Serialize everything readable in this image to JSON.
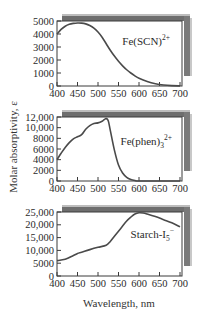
{
  "figure": {
    "ylabel": "Molar absorptivity, ε",
    "xlabel": "Wavelength, nm"
  },
  "chart_data": [
    {
      "type": "line",
      "title": "",
      "label": "Fe(SCN)",
      "label_sup": "2+",
      "label_sub": "",
      "xlabel": "Wavelength, nm",
      "ylabel": "Molar absorptivity, ε",
      "xlim": [
        400,
        700
      ],
      "ylim": [
        0,
        5000
      ],
      "xticks": [
        400,
        450,
        500,
        550,
        600,
        650,
        700
      ],
      "yticks": [
        0,
        1000,
        2000,
        3000,
        4000,
        5000
      ],
      "ytick_labels": [
        "0",
        "1000",
        "2000",
        "3000",
        "4000",
        "5000"
      ],
      "grid": false,
      "x": [
        400,
        410,
        420,
        430,
        440,
        450,
        460,
        470,
        480,
        490,
        500,
        510,
        520,
        530,
        540,
        550,
        560,
        570,
        580,
        590,
        600,
        620,
        640,
        660,
        680,
        700
      ],
      "y": [
        4000,
        4350,
        4600,
        4750,
        4820,
        4850,
        4840,
        4780,
        4650,
        4450,
        4150,
        3750,
        3250,
        2750,
        2300,
        1900,
        1550,
        1250,
        1000,
        780,
        600,
        350,
        180,
        80,
        30,
        10
      ]
    },
    {
      "type": "line",
      "title": "",
      "label": "Fe(phen)",
      "label_sup": "2+",
      "label_sub": "3",
      "xlabel": "Wavelength, nm",
      "ylabel": "Molar absorptivity, ε",
      "xlim": [
        400,
        700
      ],
      "ylim": [
        0,
        12000
      ],
      "xticks": [
        400,
        450,
        500,
        550,
        600,
        650,
        700
      ],
      "yticks": [
        0,
        2000,
        4000,
        6000,
        8000,
        10000,
        12000
      ],
      "ytick_labels": [
        "0",
        "2000",
        "4000",
        "6000",
        "8000",
        "10,000",
        "12,000"
      ],
      "grid": false,
      "x": [
        400,
        410,
        420,
        430,
        440,
        450,
        460,
        470,
        480,
        490,
        500,
        510,
        515,
        520,
        525,
        530,
        540,
        550,
        560,
        570,
        580,
        590,
        600,
        650,
        700
      ],
      "y": [
        4000,
        5200,
        6300,
        7200,
        7900,
        8300,
        8700,
        9700,
        10400,
        10800,
        10900,
        11200,
        11500,
        11700,
        11300,
        9500,
        5800,
        3000,
        1500,
        700,
        300,
        100,
        0,
        0,
        0
      ]
    },
    {
      "type": "line",
      "title": "",
      "label": "Starch-I",
      "label_sup": "−",
      "label_sub": "5",
      "xlabel": "Wavelength, nm",
      "ylabel": "Molar absorptivity, ε",
      "xlim": [
        400,
        700
      ],
      "ylim": [
        0,
        25000
      ],
      "xticks": [
        400,
        450,
        500,
        550,
        600,
        650,
        700
      ],
      "yticks": [
        0,
        5000,
        10000,
        15000,
        20000,
        25000
      ],
      "ytick_labels": [
        "0",
        "5000",
        "10,000",
        "15,000",
        "20,000",
        "25,000"
      ],
      "grid": false,
      "x": [
        400,
        420,
        440,
        450,
        460,
        480,
        500,
        520,
        530,
        540,
        550,
        560,
        570,
        580,
        590,
        600,
        610,
        620,
        640,
        660,
        680,
        700
      ],
      "y": [
        6000,
        6500,
        8000,
        8800,
        9300,
        10300,
        11200,
        12000,
        13500,
        15500,
        17500,
        19500,
        21500,
        23000,
        24200,
        24700,
        24600,
        24200,
        23200,
        22000,
        20800,
        19200
      ]
    }
  ]
}
